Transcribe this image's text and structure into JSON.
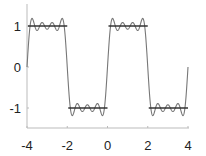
{
  "chart_data": {
    "type": "line",
    "title": "",
    "xlabel": "",
    "ylabel": "",
    "xlim": [
      -4,
      4
    ],
    "ylim": [
      -1.5,
      1.5
    ],
    "grid": false,
    "legend": null,
    "x_ticks": [
      -4,
      -2,
      0,
      2,
      4
    ],
    "x_tick_labels": [
      "-4",
      "-2",
      "0",
      "2",
      "4"
    ],
    "y_ticks": [
      1,
      0,
      -1
    ],
    "y_tick_labels": [
      "1",
      "0",
      "-1"
    ],
    "series": [
      {
        "name": "square wave",
        "description": "Square wave of period 4, amplitude 1: +1 on (-4,-2) and (0,2), -1 on (-2,0) and (2,4)",
        "segments": [
          {
            "x": [
              -4,
              -2
            ],
            "y": [
              1,
              1
            ]
          },
          {
            "x": [
              -2,
              0
            ],
            "y": [
              -1,
              -1
            ]
          },
          {
            "x": [
              0,
              2
            ],
            "y": [
              1,
              1
            ]
          },
          {
            "x": [
              2,
              4
            ],
            "y": [
              -1,
              -1
            ]
          }
        ],
        "color": "#333333"
      },
      {
        "name": "Fourier partial sum",
        "description": "Partial Fourier series of the square wave using odd harmonics 1,3,5,7 (Gibbs ringing near jumps)",
        "formula": "(4/pi) * sum_{k odd, k<=7} sin(k*pi*x/2)/k",
        "harmonics": [
          1,
          3,
          5,
          7
        ],
        "period": 4,
        "color": "#777777"
      }
    ]
  }
}
